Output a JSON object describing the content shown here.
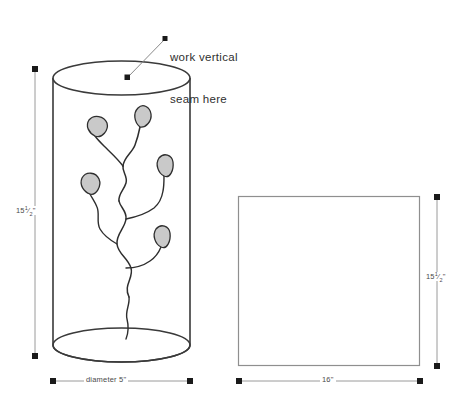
{
  "diagram": {
    "callout": {
      "line1": "work vertical",
      "line2": "seam here"
    },
    "colors": {
      "outline": "#3a3a3a",
      "leaf_fill": "#c9c9c9",
      "leaf_stroke": "#3a3a3a",
      "dimension_line": "#9a9a9a",
      "dimension_marker": "#1a1a1a",
      "rect_stroke": "#8f8f8f",
      "leader_line": "#8a8a8a",
      "background": "#ffffff"
    },
    "cylinder": {
      "name": "cylinder-vessel",
      "height_label": "15",
      "height_fraction_numerator": "1",
      "height_fraction_denominator": "2",
      "height_unit": "\"",
      "diameter_label": "diameter 5\""
    },
    "panel": {
      "name": "flat-rectangular-panel",
      "height_label": "15",
      "height_fraction_numerator": "1",
      "height_fraction_denominator": "2",
      "height_unit": "\"",
      "width_label": "16\""
    },
    "motif": {
      "name": "vine-with-leaves",
      "leaf_count": 5,
      "description": "curving vine branch with five pointed leaves"
    },
    "icons": {
      "seam_marker": "square-dot-marker",
      "dimension_endpoint": "square-endpoint-marker"
    }
  }
}
